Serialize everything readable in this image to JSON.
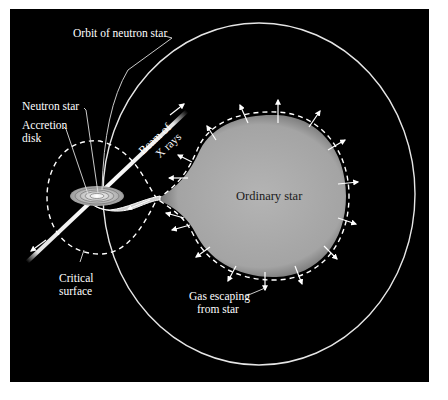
{
  "figure": {
    "background_color": "#000000",
    "line_color": "#ffffff",
    "star_color": "#a9a9a9",
    "labels": {
      "orbit": "Orbit of neutron star",
      "neutron_star": "Neutron star",
      "accretion_line1": "Accretion",
      "accretion_line2": "disk",
      "beam_line1": "Beam of",
      "beam_line2": "X rays",
      "ordinary_star": "Ordinary star",
      "critical_line1": "Critical",
      "critical_line2": "surface",
      "gas_line1": "Gas escaping",
      "gas_line2": "from star"
    }
  }
}
